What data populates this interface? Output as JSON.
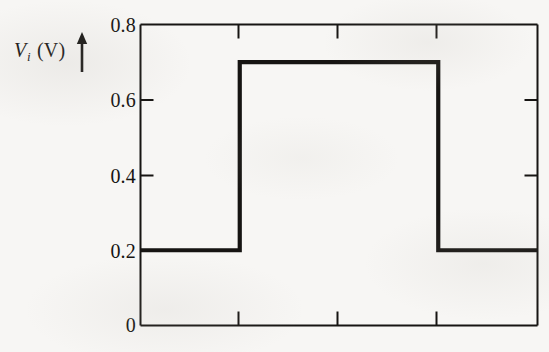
{
  "figure": {
    "background_color": "#f7f6f4",
    "ink_color": "#161412",
    "axis_label": {
      "variable": "V",
      "subscript": "i",
      "units": "(V)",
      "full": "Vi (V)",
      "arrow": "up-arrow"
    }
  },
  "chart_data": {
    "type": "line",
    "title": "",
    "xlabel": "",
    "ylabel": "Vi (V)",
    "ylim": [
      0,
      0.8
    ],
    "xlim": [
      0,
      4
    ],
    "grid": false,
    "legend": null,
    "y_ticks": [
      0,
      0.2,
      0.4,
      0.6,
      0.8
    ],
    "y_tick_labels": [
      "0",
      "0.2",
      "0.4",
      "0.6",
      "0.8"
    ],
    "x_ticks": [
      1,
      2,
      3
    ],
    "x_tick_labels": [
      "",
      "",
      ""
    ],
    "series": [
      {
        "name": "Vi",
        "comment": "square input pulse: low 0.2 V, high 0.7 V",
        "low_level": 0.2,
        "high_level": 0.7,
        "x": [
          0,
          1,
          1,
          3,
          3,
          4
        ],
        "y": [
          0.2,
          0.2,
          0.7,
          0.7,
          0.2,
          0.2
        ]
      }
    ]
  },
  "tick_labels": {
    "y0": "0",
    "y1": "0.2",
    "y2": "0.4",
    "y3": "0.6",
    "y4": "0.8"
  }
}
